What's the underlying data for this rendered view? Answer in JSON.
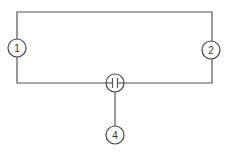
{
  "diagram": {
    "type": "circuit-schematic",
    "colors": {
      "line": "#555555",
      "background": "#ffffff"
    },
    "nodes": [
      {
        "id": "1",
        "label": "1",
        "cx": 17,
        "cy": 48,
        "r": 9
      },
      {
        "id": "2",
        "label": "2",
        "cx": 211,
        "cy": 50,
        "r": 9
      },
      {
        "id": "capacitor",
        "label": "",
        "symbol": "capacitor",
        "cx": 115,
        "cy": 83,
        "r": 9
      },
      {
        "id": "4",
        "label": "4",
        "cx": 115,
        "cy": 135,
        "r": 9
      }
    ],
    "edges": [
      {
        "from": "1",
        "to": "2",
        "route": "top"
      },
      {
        "from": "1",
        "to": "capacitor",
        "route": "bottom-left"
      },
      {
        "from": "capacitor",
        "to": "2",
        "route": "bottom-right"
      },
      {
        "from": "capacitor",
        "to": "4",
        "route": "vertical"
      }
    ]
  }
}
